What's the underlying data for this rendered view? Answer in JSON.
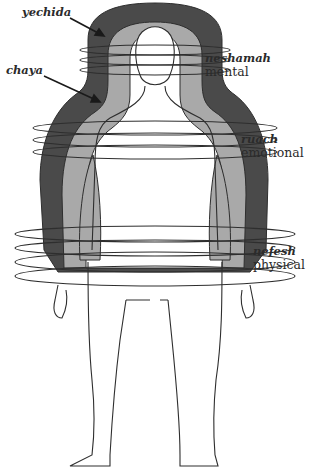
{
  "diagram": {
    "type": "aura-layers-of-the-soul",
    "colors": {
      "background": "#ffffff",
      "outer_layer": "#4a4a4a",
      "inner_layer": "#a9a9a9",
      "body_fill": "#ffffff",
      "line": "#2e2e2e"
    },
    "labels": [
      {
        "id": "yechida",
        "name": "yechida",
        "sub": ""
      },
      {
        "id": "chaya",
        "name": "chaya",
        "sub": ""
      },
      {
        "id": "neshamah",
        "name": "neshamah",
        "sub": "mental"
      },
      {
        "id": "ruach",
        "name": "ruach",
        "sub": "emotional"
      },
      {
        "id": "nefesh",
        "name": "nefesh",
        "sub": "physical"
      }
    ]
  }
}
